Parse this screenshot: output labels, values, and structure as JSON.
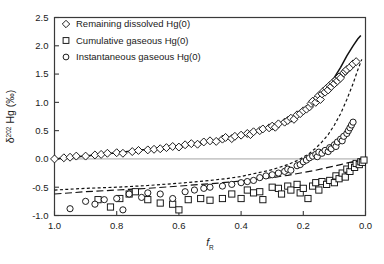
{
  "chart_data": {
    "type": "scatter",
    "title": "",
    "xlabel": "f_R",
    "xlabel_base": "f",
    "xlabel_sub": "R",
    "ylabel": "δ202 Hg (‰)",
    "ylabel_symbol": "δ",
    "ylabel_sup": "202",
    "ylabel_rest": " Hg (‰)",
    "xlim": [
      1.0,
      0.0
    ],
    "ylim": [
      -1.0,
      2.5
    ],
    "x_ticks": [
      "1.0",
      "0.8",
      "0.6",
      "0.4",
      "0.2",
      "0.0"
    ],
    "x_tick_values": [
      1.0,
      0.8,
      0.6,
      0.4,
      0.2,
      0.0
    ],
    "y_ticks": [
      "-1.0",
      "-0.5",
      "0.0",
      "0.5",
      "1.0",
      "1.5",
      "2.0",
      "2.5"
    ],
    "y_tick_values": [
      -1.0,
      -0.5,
      0.0,
      0.5,
      1.0,
      1.5,
      2.0,
      2.5
    ],
    "x_axis_reversed": true,
    "grid": false,
    "legend_position": "top-left",
    "legend": [
      {
        "label": "Remaining dissolved Hg(0)",
        "marker": "diamond"
      },
      {
        "label": "Cumulative gaseous Hg(0)",
        "marker": "square"
      },
      {
        "label": "Instantaneous gaseous Hg(0)",
        "marker": "circle"
      }
    ],
    "series": [
      {
        "name": "Remaining dissolved Hg(0)",
        "marker": "diamond",
        "points": [
          [
            1.0,
            0.0
          ],
          [
            0.97,
            0.02
          ],
          [
            0.95,
            0.03
          ],
          [
            0.93,
            0.05
          ],
          [
            0.9,
            0.05
          ],
          [
            0.87,
            0.07
          ],
          [
            0.85,
            0.08
          ],
          [
            0.83,
            0.1
          ],
          [
            0.8,
            0.11
          ],
          [
            0.78,
            0.1
          ],
          [
            0.75,
            0.13
          ],
          [
            0.73,
            0.15
          ],
          [
            0.7,
            0.16
          ],
          [
            0.68,
            0.17
          ],
          [
            0.66,
            0.18
          ],
          [
            0.64,
            0.2
          ],
          [
            0.62,
            0.22
          ],
          [
            0.6,
            0.21
          ],
          [
            0.58,
            0.25
          ],
          [
            0.56,
            0.27
          ],
          [
            0.54,
            0.26
          ],
          [
            0.52,
            0.3
          ],
          [
            0.5,
            0.32
          ],
          [
            0.48,
            0.31
          ],
          [
            0.46,
            0.35
          ],
          [
            0.45,
            0.38
          ],
          [
            0.43,
            0.36
          ],
          [
            0.42,
            0.4
          ],
          [
            0.4,
            0.42
          ],
          [
            0.38,
            0.45
          ],
          [
            0.37,
            0.43
          ],
          [
            0.36,
            0.48
          ],
          [
            0.34,
            0.5
          ],
          [
            0.33,
            0.53
          ],
          [
            0.31,
            0.55
          ],
          [
            0.3,
            0.58
          ],
          [
            0.29,
            0.56
          ],
          [
            0.28,
            0.62
          ],
          [
            0.26,
            0.65
          ],
          [
            0.25,
            0.68
          ],
          [
            0.24,
            0.72
          ],
          [
            0.23,
            0.7
          ],
          [
            0.22,
            0.78
          ],
          [
            0.21,
            0.8
          ],
          [
            0.2,
            0.85
          ],
          [
            0.19,
            0.88
          ],
          [
            0.18,
            0.92
          ],
          [
            0.175,
            0.98
          ],
          [
            0.17,
            1.02
          ],
          [
            0.16,
            1.0
          ],
          [
            0.155,
            1.08
          ],
          [
            0.15,
            1.12
          ],
          [
            0.145,
            1.05
          ],
          [
            0.14,
            1.15
          ],
          [
            0.135,
            1.2
          ],
          [
            0.13,
            1.18
          ],
          [
            0.125,
            1.25
          ],
          [
            0.12,
            1.22
          ],
          [
            0.115,
            1.3
          ],
          [
            0.11,
            1.28
          ],
          [
            0.105,
            1.35
          ],
          [
            0.1,
            1.33
          ],
          [
            0.095,
            1.4
          ],
          [
            0.09,
            1.38
          ],
          [
            0.085,
            1.45
          ],
          [
            0.08,
            1.43
          ],
          [
            0.07,
            1.52
          ],
          [
            0.065,
            1.55
          ],
          [
            0.06,
            1.58
          ],
          [
            0.05,
            1.62
          ],
          [
            0.04,
            1.68
          ],
          [
            0.03,
            1.72
          ]
        ]
      },
      {
        "name": "Cumulative gaseous Hg(0)",
        "marker": "square",
        "points": [
          [
            0.86,
            -0.72
          ],
          [
            0.82,
            -0.85
          ],
          [
            0.79,
            -0.7
          ],
          [
            0.76,
            -0.62
          ],
          [
            0.74,
            -0.58
          ],
          [
            0.7,
            -0.72
          ],
          [
            0.66,
            -0.78
          ],
          [
            0.62,
            -0.8
          ],
          [
            0.6,
            -0.9
          ],
          [
            0.57,
            -0.72
          ],
          [
            0.53,
            -0.7
          ],
          [
            0.5,
            -0.73
          ],
          [
            0.46,
            -0.7
          ],
          [
            0.43,
            -0.62
          ],
          [
            0.4,
            -0.7
          ],
          [
            0.38,
            -0.55
          ],
          [
            0.36,
            -0.6
          ],
          [
            0.34,
            -0.58
          ],
          [
            0.33,
            -0.72
          ],
          [
            0.3,
            -0.5
          ],
          [
            0.28,
            -0.52
          ],
          [
            0.27,
            -0.62
          ],
          [
            0.25,
            -0.48
          ],
          [
            0.24,
            -0.55
          ],
          [
            0.22,
            -0.45
          ],
          [
            0.21,
            -0.6
          ],
          [
            0.2,
            -0.52
          ],
          [
            0.185,
            -0.7
          ],
          [
            0.17,
            -0.48
          ],
          [
            0.16,
            -0.42
          ],
          [
            0.15,
            -0.55
          ],
          [
            0.14,
            -0.4
          ],
          [
            0.125,
            -0.45
          ],
          [
            0.115,
            -0.38
          ],
          [
            0.1,
            -0.42
          ],
          [
            0.095,
            -0.3
          ],
          [
            0.085,
            -0.35
          ],
          [
            0.075,
            -0.25
          ],
          [
            0.065,
            -0.32
          ],
          [
            0.06,
            -0.18
          ],
          [
            0.05,
            -0.22
          ],
          [
            0.045,
            -0.12
          ],
          [
            0.035,
            -0.15
          ],
          [
            0.03,
            -0.08
          ],
          [
            0.02,
            -0.1
          ],
          [
            0.015,
            -0.05
          ],
          [
            0.01,
            -0.06
          ],
          [
            0.005,
            -0.02
          ]
        ]
      },
      {
        "name": "Instantaneous gaseous Hg(0)",
        "marker": "circle",
        "points": [
          [
            0.95,
            -0.88
          ],
          [
            0.9,
            -0.75
          ],
          [
            0.87,
            -0.8
          ],
          [
            0.84,
            -0.72
          ],
          [
            0.8,
            -0.7
          ],
          [
            0.78,
            -0.9
          ],
          [
            0.76,
            -0.62
          ],
          [
            0.72,
            -0.68
          ],
          [
            0.7,
            -0.6
          ],
          [
            0.66,
            -0.62
          ],
          [
            0.62,
            -0.7
          ],
          [
            0.58,
            -0.58
          ],
          [
            0.55,
            -0.55
          ],
          [
            0.52,
            -0.52
          ],
          [
            0.5,
            -0.5
          ],
          [
            0.46,
            -0.48
          ],
          [
            0.43,
            -0.45
          ],
          [
            0.4,
            -0.42
          ],
          [
            0.38,
            -0.4
          ],
          [
            0.36,
            -0.38
          ],
          [
            0.34,
            -0.33
          ],
          [
            0.32,
            -0.3
          ],
          [
            0.3,
            -0.28
          ],
          [
            0.28,
            -0.25
          ],
          [
            0.26,
            -0.22
          ],
          [
            0.25,
            -0.18
          ],
          [
            0.24,
            -0.2
          ],
          [
            0.22,
            -0.12
          ],
          [
            0.21,
            -0.1
          ],
          [
            0.2,
            -0.05
          ],
          [
            0.19,
            -0.02
          ],
          [
            0.18,
            0.02
          ],
          [
            0.17,
            0.05
          ],
          [
            0.16,
            0.08
          ],
          [
            0.155,
            0.04
          ],
          [
            0.15,
            0.12
          ],
          [
            0.14,
            0.1
          ],
          [
            0.13,
            0.15
          ],
          [
            0.12,
            0.13
          ],
          [
            0.115,
            0.2
          ],
          [
            0.11,
            0.18
          ],
          [
            0.1,
            0.25
          ],
          [
            0.095,
            0.22
          ],
          [
            0.09,
            0.3
          ],
          [
            0.08,
            0.35
          ],
          [
            0.075,
            0.32
          ],
          [
            0.07,
            0.4
          ],
          [
            0.06,
            0.45
          ],
          [
            0.055,
            0.5
          ],
          [
            0.05,
            0.55
          ],
          [
            0.045,
            0.6
          ],
          [
            0.04,
            0.65
          ]
        ]
      }
    ],
    "curves": [
      {
        "name": "dissolved-model-solid",
        "style": "solid",
        "points": [
          [
            1.0,
            0.0
          ],
          [
            0.9,
            0.05
          ],
          [
            0.8,
            0.11
          ],
          [
            0.7,
            0.17
          ],
          [
            0.6,
            0.23
          ],
          [
            0.5,
            0.31
          ],
          [
            0.45,
            0.36
          ],
          [
            0.4,
            0.42
          ],
          [
            0.35,
            0.49
          ],
          [
            0.3,
            0.57
          ],
          [
            0.25,
            0.68
          ],
          [
            0.22,
            0.76
          ],
          [
            0.2,
            0.83
          ],
          [
            0.18,
            0.91
          ],
          [
            0.16,
            1.01
          ],
          [
            0.14,
            1.13
          ],
          [
            0.12,
            1.27
          ],
          [
            0.1,
            1.44
          ],
          [
            0.08,
            1.62
          ],
          [
            0.06,
            1.82
          ],
          [
            0.04,
            2.0
          ],
          [
            0.025,
            2.12
          ],
          [
            0.015,
            2.18
          ]
        ]
      },
      {
        "name": "instantaneous-model-fine-dashed",
        "style": "fine-dashed",
        "points": [
          [
            1.0,
            -0.55
          ],
          [
            0.9,
            -0.52
          ],
          [
            0.8,
            -0.5
          ],
          [
            0.7,
            -0.47
          ],
          [
            0.6,
            -0.43
          ],
          [
            0.5,
            -0.38
          ],
          [
            0.45,
            -0.35
          ],
          [
            0.4,
            -0.31
          ],
          [
            0.35,
            -0.25
          ],
          [
            0.3,
            -0.19
          ],
          [
            0.25,
            -0.1
          ],
          [
            0.22,
            -0.03
          ],
          [
            0.2,
            0.03
          ],
          [
            0.18,
            0.1
          ],
          [
            0.16,
            0.19
          ],
          [
            0.14,
            0.3
          ],
          [
            0.12,
            0.43
          ],
          [
            0.1,
            0.6
          ],
          [
            0.08,
            0.8
          ],
          [
            0.06,
            1.05
          ],
          [
            0.04,
            1.33
          ],
          [
            0.025,
            1.57
          ],
          [
            0.012,
            1.76
          ]
        ]
      },
      {
        "name": "cumulative-model-long-dashed",
        "style": "long-dashed",
        "points": [
          [
            1.0,
            -0.62
          ],
          [
            0.9,
            -0.58
          ],
          [
            0.8,
            -0.55
          ],
          [
            0.7,
            -0.52
          ],
          [
            0.6,
            -0.48
          ],
          [
            0.5,
            -0.44
          ],
          [
            0.4,
            -0.39
          ],
          [
            0.35,
            -0.36
          ],
          [
            0.3,
            -0.33
          ],
          [
            0.25,
            -0.29
          ],
          [
            0.2,
            -0.24
          ],
          [
            0.16,
            -0.2
          ],
          [
            0.12,
            -0.15
          ],
          [
            0.08,
            -0.1
          ],
          [
            0.05,
            -0.06
          ],
          [
            0.02,
            -0.02
          ],
          [
            0.0,
            0.0
          ]
        ]
      }
    ]
  }
}
